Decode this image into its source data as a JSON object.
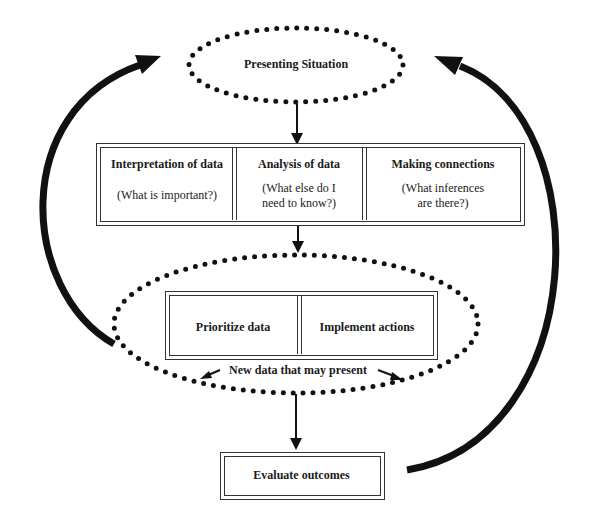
{
  "diagram": {
    "top_node": {
      "label": "Presenting Situation",
      "shape": "dotted-ellipse"
    },
    "assessment_box": {
      "cells": [
        {
          "title": "Interpretation of data",
          "subtitle": "(What is important?)"
        },
        {
          "title": "Analysis of data",
          "subtitle": "(What else do I need to know?)",
          "subtitle_line1": "(What else do I",
          "subtitle_line2": "need to know?)"
        },
        {
          "title": "Making connections",
          "subtitle": "(What inferences are there?)",
          "subtitle_line1": "(What inferences",
          "subtitle_line2": "are there?)"
        }
      ]
    },
    "action_ellipse": {
      "shape": "dotted-ellipse",
      "cells": [
        {
          "title": "Prioritize data"
        },
        {
          "title": "Implement actions"
        }
      ],
      "note": "New data that may present"
    },
    "bottom_node": {
      "label": "Evaluate outcomes"
    },
    "edges": [
      {
        "from": "Presenting Situation",
        "to": "Interpretation of data / Analysis of data / Making connections"
      },
      {
        "from": "Interpretation of data",
        "to": "Analysis of data"
      },
      {
        "from": "Analysis of data",
        "to": "Making connections"
      },
      {
        "from": "Analysis box",
        "to": "Prioritize data / Implement actions"
      },
      {
        "from": "Prioritize data",
        "to": "Implement actions"
      },
      {
        "from": "Action ellipse",
        "to": "Evaluate outcomes"
      },
      {
        "from": "Action ellipse (left)",
        "to": "Presenting Situation",
        "style": "thick curved feedback arrow"
      },
      {
        "from": "Evaluate outcomes",
        "to": "Presenting Situation",
        "style": "thick curved feedback arrow"
      }
    ],
    "colors": {
      "stroke": "#111111",
      "background": "#ffffff"
    }
  }
}
